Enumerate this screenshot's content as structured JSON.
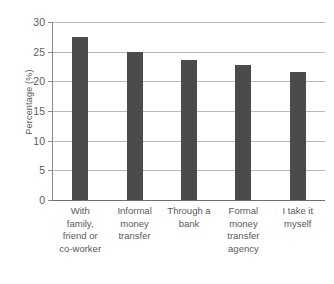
{
  "chart_data": {
    "type": "bar",
    "title": "",
    "xlabel": "",
    "ylabel": "Percentage (%)",
    "categories": [
      "With family, friend or co-worker",
      "Informal money transfer",
      "Through a bank",
      "Formal money transfer agency",
      "I take it myself"
    ],
    "category_lines": [
      [
        "With",
        "family,",
        "friend or",
        "co-worker"
      ],
      [
        "Informal",
        "money",
        "transfer"
      ],
      [
        "Through a",
        "bank"
      ],
      [
        "Formal",
        "money",
        "transfer",
        "agency"
      ],
      [
        "I take it",
        "myself"
      ]
    ],
    "values": [
      27.5,
      25.0,
      23.6,
      22.8,
      21.6
    ],
    "ylim": [
      0,
      30
    ],
    "y_ticks": [
      0,
      5,
      10,
      15,
      20,
      25,
      30
    ],
    "y_tick_labels": [
      "0",
      "5",
      "10",
      "15",
      "20",
      "25",
      "30"
    ],
    "grid": true,
    "legend": null,
    "bar_color": "#4b4b4b",
    "gridline_color": "#b9b9b9",
    "axis_color": "#6f6f6f",
    "background_color": "#ffffff"
  }
}
